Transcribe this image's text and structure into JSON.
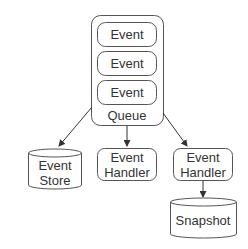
{
  "diagram": {
    "queue": {
      "label": "Queue",
      "events": [
        {
          "label": "Event"
        },
        {
          "label": "Event"
        },
        {
          "label": "Event"
        }
      ]
    },
    "event_store": {
      "line1": "Event",
      "line2": "Store"
    },
    "handler_middle": {
      "line1": "Event",
      "line2": "Handler"
    },
    "handler_right": {
      "line1": "Event",
      "line2": "Handler"
    },
    "snapshot": {
      "label": "Snapshot"
    },
    "edges": [
      {
        "from": "Queue",
        "to": "Event Store"
      },
      {
        "from": "Queue",
        "to": "Event Handler (middle)"
      },
      {
        "from": "Queue",
        "to": "Event Handler (right)"
      },
      {
        "from": "Event Handler (right)",
        "to": "Snapshot"
      }
    ],
    "colors": {
      "stroke": "#555555",
      "text": "#333333",
      "background": "#ffffff"
    }
  }
}
